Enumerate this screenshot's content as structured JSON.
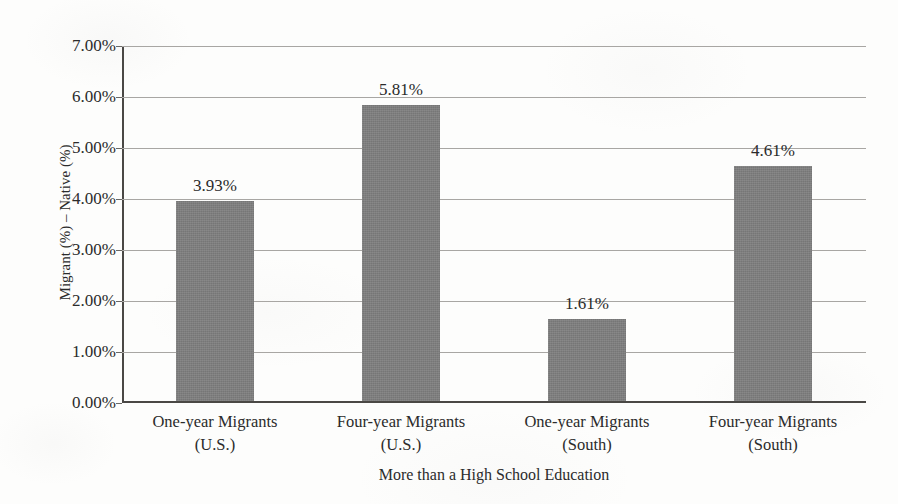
{
  "chart_data": {
    "type": "bar",
    "title": "",
    "subtitle": "",
    "xlabel": "More than a High School Education",
    "ylabel": "Migrant (%) – Native (%)",
    "categories": [
      "One-year Migrants\n(U.S.)",
      "Four-year Migrants\n(U.S.)",
      "One-year Migrants\n(South)",
      "Four-year Migrants\n(South)"
    ],
    "category_lines": [
      [
        "One-year Migrants",
        "(U.S.)"
      ],
      [
        "Four-year Migrants",
        "(U.S.)"
      ],
      [
        "One-year Migrants",
        "(South)"
      ],
      [
        "Four-year Migrants",
        "(South)"
      ]
    ],
    "values": [
      3.93,
      5.81,
      1.61,
      4.61
    ],
    "value_labels": [
      "3.93%",
      "5.81%",
      "1.61%",
      "4.61%"
    ],
    "ylim": [
      0,
      7
    ],
    "ytick_values": [
      0,
      1,
      2,
      3,
      4,
      5,
      6,
      7
    ],
    "ytick_labels": [
      "0.00%",
      "1.00%",
      "2.00%",
      "3.00%",
      "4.00%",
      "5.00%",
      "6.00%",
      "7.00%"
    ],
    "grid": true,
    "grid_axis": "y",
    "legend": false,
    "legend_position": "none",
    "bar_color": "#7d7d7d",
    "axis_color": "#4a4845",
    "grid_color": "#a8a6a3",
    "text_color": "#2b2b2b",
    "background_color": "#fdfdfc",
    "series": [
      {
        "name": "Migrant minus Native percentage point difference",
        "values": [
          3.93,
          5.81,
          1.61,
          4.61
        ]
      }
    ]
  }
}
